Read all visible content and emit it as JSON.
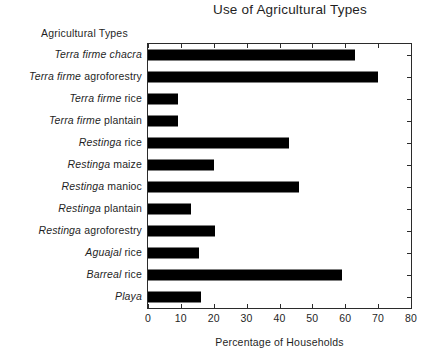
{
  "chart_data": {
    "type": "bar",
    "orientation": "horizontal",
    "title": "Use of Agricultural Types",
    "xlabel": "Percentage of Households",
    "ylabel": "Agricultural Types",
    "xlim": [
      0,
      80
    ],
    "xticks": [
      0,
      10,
      20,
      30,
      40,
      50,
      60,
      70,
      80
    ],
    "xtick_labels": [
      "0",
      "10",
      "20",
      "30",
      "40",
      "50",
      "60",
      "70",
      "80"
    ],
    "grid": false,
    "legend": null,
    "bar_color": "#000000",
    "categories": [
      "Terra firme chacra",
      "Terra firme agroforestry",
      "Terra firme rice",
      "Terra firme plantain",
      "Restinga rice",
      "Restinga maize",
      "Restinga manioc",
      "Restinga plantain",
      "Restinga agroforestry",
      "Aguajal rice",
      "Barreal rice",
      "Playa"
    ],
    "values": [
      63,
      70,
      9,
      9,
      43,
      20,
      46,
      13,
      20.5,
      15.5,
      59,
      16
    ],
    "category_parts": [
      {
        "italic": "Terra firme chacra",
        "upright": ""
      },
      {
        "italic": "Terra firme ",
        "upright": "agroforestry"
      },
      {
        "italic": "Terra firme ",
        "upright": "rice"
      },
      {
        "italic": "Terra firme ",
        "upright": "plantain"
      },
      {
        "italic": "Restinga ",
        "upright": "rice"
      },
      {
        "italic": "Restinga ",
        "upright": "maize"
      },
      {
        "italic": "Restinga ",
        "upright": "manioc"
      },
      {
        "italic": "Restinga ",
        "upright": "plantain"
      },
      {
        "italic": "Restinga ",
        "upright": "agroforestry"
      },
      {
        "italic": "Aguajal ",
        "upright": "rice"
      },
      {
        "italic": "Barreal ",
        "upright": "rice"
      },
      {
        "italic": "Playa",
        "upright": ""
      }
    ]
  }
}
